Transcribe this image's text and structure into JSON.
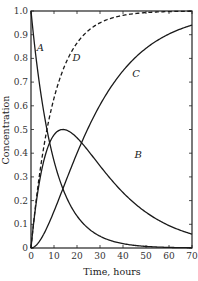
{
  "chart_data": {
    "type": "line",
    "title": "",
    "xlabel": "Time, hours",
    "ylabel": "Concentration",
    "xlim": [
      0,
      70
    ],
    "ylim": [
      0,
      1.0
    ],
    "grid": false,
    "legend": "inline curve labels",
    "x_ticks": [
      0,
      10,
      20,
      30,
      40,
      50,
      60,
      70
    ],
    "y_ticks": [
      0,
      0.1,
      0.2,
      0.3,
      0.4,
      0.5,
      0.6,
      0.7,
      0.8,
      0.9,
      1.0
    ],
    "x_tick_labels": [
      "0",
      "10",
      "20",
      "30",
      "40",
      "50",
      "60",
      "70"
    ],
    "y_tick_labels": [
      "0",
      "0.1",
      "0.2",
      "0.3",
      "0.4",
      "0.5",
      "0.6",
      "0.7",
      "0.8",
      "0.9",
      "1.0"
    ],
    "x": [
      0,
      2,
      4,
      7,
      10,
      14,
      20,
      25,
      30,
      40,
      50,
      60,
      70
    ],
    "series": [
      {
        "name": "A",
        "style": "solid",
        "values": [
          1.0,
          0.82,
          0.67,
          0.5,
          0.37,
          0.25,
          0.14,
          0.08,
          0.05,
          0.02,
          0.01,
          0.0,
          0.0
        ]
      },
      {
        "name": "B",
        "style": "solid",
        "values": [
          0.0,
          0.17,
          0.3,
          0.41,
          0.47,
          0.5,
          0.47,
          0.42,
          0.35,
          0.24,
          0.16,
          0.1,
          0.06
        ]
      },
      {
        "name": "C",
        "style": "solid",
        "values": [
          0.0,
          0.01,
          0.03,
          0.09,
          0.16,
          0.25,
          0.4,
          0.5,
          0.6,
          0.74,
          0.83,
          0.9,
          0.94
        ]
      },
      {
        "name": "D",
        "style": "dashed",
        "values": [
          0.0,
          0.18,
          0.33,
          0.5,
          0.63,
          0.75,
          0.86,
          0.92,
          0.95,
          0.98,
          0.99,
          1.0,
          1.0
        ]
      }
    ],
    "annotations": [
      {
        "text": "A",
        "x": 2.5,
        "y": 0.83
      },
      {
        "text": "B",
        "x": 45,
        "y": 0.38
      },
      {
        "text": "C",
        "x": 44,
        "y": 0.72
      },
      {
        "text": "D",
        "x": 18,
        "y": 0.79
      }
    ]
  }
}
